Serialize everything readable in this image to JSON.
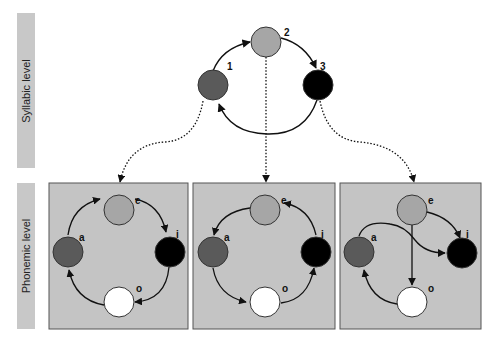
{
  "levels": {
    "syllabic": "Syllabic level",
    "phonemic": "Phonemic level"
  },
  "syllabic": {
    "nodes": [
      {
        "id": "1",
        "label": "1",
        "color": "#5a5a5a"
      },
      {
        "id": "2",
        "label": "2",
        "color": "#a6a6a6"
      },
      {
        "id": "3",
        "label": "3",
        "color": "#000000"
      }
    ]
  },
  "phonemic": {
    "panel_background": "#c4c4c4",
    "nodes": [
      {
        "id": "a",
        "label": "a",
        "color": "#5a5a5a"
      },
      {
        "id": "e",
        "label": "e",
        "color": "#a6a6a6"
      },
      {
        "id": "i",
        "label": "i",
        "color": "#000000"
      },
      {
        "id": "o",
        "label": "o",
        "color": "#ffffff"
      }
    ],
    "panels": [
      {
        "name": "panel-1",
        "edges": [
          "a→e",
          "e→i",
          "i→o",
          "o→a"
        ]
      },
      {
        "name": "panel-2",
        "edges": [
          "e→a",
          "a→o",
          "o→i",
          "i→e"
        ]
      },
      {
        "name": "panel-3",
        "edges": [
          "e→i",
          "e→o",
          "a→i",
          "o→a"
        ]
      }
    ]
  }
}
